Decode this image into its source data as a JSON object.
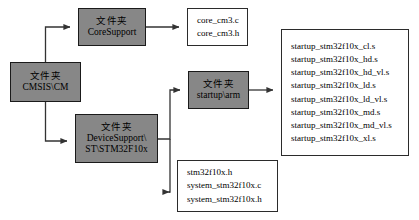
{
  "diagram": {
    "colors": {
      "folder_fill": "#878787",
      "folder_border": "#1a1a1a",
      "file_fill": "#ffffff",
      "file_border": "#2b2b2b",
      "line": "#333333"
    }
  },
  "nodes": {
    "cmsis": {
      "type": "folder",
      "line1": "文件夹",
      "line2": "CMSIS\\CM"
    },
    "core_support": {
      "type": "folder",
      "line1": "文件夹",
      "line2": "CoreSupport"
    },
    "startup_arm": {
      "type": "folder",
      "line1": "文件夹",
      "line2": "startup\\arm"
    },
    "device_support": {
      "type": "folder",
      "line1": "文件夹",
      "line2": "DeviceSupport\\",
      "line3": "ST\\STM32F10x"
    },
    "core_cm3_files": {
      "type": "filelist",
      "files": [
        "core_cm3.c",
        "core_cm3.h"
      ]
    },
    "startup_files": {
      "type": "filelist",
      "files": [
        "startup_stm32f10x_cl.s",
        "startup_stm32f10x_hd.s",
        "startup_stm32f10x_hd_vl.s",
        "startup_stm32f10x_ld.s",
        "startup_stm32f10x_ld_vl.s",
        "startup_stm32f10x_md.s",
        "startup_stm32f10x_md_vl.s",
        "startup_stm32f10x_xl.s"
      ]
    },
    "stm32f10x_files": {
      "type": "filelist",
      "files": [
        "stm32f10x.h",
        "system_stm32f10x.c",
        "system_stm32f10x.h"
      ]
    }
  },
  "edges": [
    {
      "from": "cmsis",
      "to": "core_support"
    },
    {
      "from": "cmsis",
      "to": "device_support"
    },
    {
      "from": "core_support",
      "to": "core_cm3_files"
    },
    {
      "from": "device_support",
      "to": "startup_arm"
    },
    {
      "from": "device_support",
      "to": "stm32f10x_files"
    },
    {
      "from": "startup_arm",
      "to": "startup_files"
    }
  ]
}
